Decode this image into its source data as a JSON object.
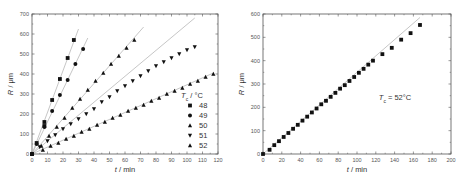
{
  "chart_data": [
    {
      "type": "scatter",
      "title": "",
      "xlabel": "t / min",
      "ylabel": "R / μm",
      "xlim": [
        0,
        120
      ],
      "ylim": [
        0,
        700
      ],
      "xticks": [
        0,
        10,
        20,
        30,
        40,
        50,
        60,
        70,
        80,
        90,
        100,
        110,
        120
      ],
      "yticks": [
        0,
        100,
        200,
        300,
        400,
        500,
        600,
        700
      ],
      "grid": false,
      "legend_title": "Tc / °C",
      "legend_position": "lower right",
      "series": [
        {
          "name": "48",
          "marker": "square",
          "x": [
            0,
            3,
            8,
            8,
            13,
            18,
            23,
            27
          ],
          "y": [
            0,
            55,
            140,
            160,
            270,
            375,
            480,
            570
          ],
          "fit_line": {
            "x0": 0,
            "y0": 0,
            "x1": 30,
            "y1": 625
          }
        },
        {
          "name": "49",
          "marker": "circle",
          "x": [
            0,
            3,
            8,
            13,
            18,
            23,
            28,
            33
          ],
          "y": [
            0,
            50,
            135,
            215,
            295,
            370,
            450,
            525
          ],
          "fit_line": {
            "x0": 0,
            "y0": 0,
            "x1": 36,
            "y1": 580
          }
        },
        {
          "name": "50",
          "marker": "triangle-up",
          "x": [
            0,
            6,
            11,
            16,
            21,
            26,
            31,
            36,
            41,
            46,
            51,
            56,
            61,
            66
          ],
          "y": [
            0,
            40,
            90,
            135,
            180,
            230,
            275,
            320,
            365,
            405,
            450,
            490,
            530,
            570
          ],
          "fit_line": {
            "x0": 0,
            "y0": 0,
            "x1": 72,
            "y1": 635
          }
        },
        {
          "name": "51",
          "marker": "triangle-down",
          "x": [
            0,
            5,
            10,
            15,
            20,
            25,
            30,
            35,
            40,
            45,
            50,
            55,
            60,
            65,
            70,
            75,
            80,
            85,
            90,
            95,
            100,
            105
          ],
          "y": [
            0,
            35,
            65,
            95,
            125,
            150,
            175,
            200,
            225,
            260,
            285,
            315,
            340,
            365,
            390,
            415,
            440,
            460,
            480,
            500,
            520,
            535
          ],
          "fit_line": {
            "x0": 0,
            "y0": 0,
            "x1": 105,
            "y1": 680
          }
        },
        {
          "name": "52",
          "marker": "triangle-up",
          "x": [
            0,
            7,
            12,
            17,
            22,
            27,
            32,
            37,
            42,
            47,
            52,
            57,
            62,
            67,
            72,
            77,
            82,
            87,
            92,
            97,
            102,
            107,
            112,
            117
          ],
          "y": [
            0,
            20,
            40,
            55,
            75,
            90,
            110,
            125,
            145,
            160,
            180,
            195,
            215,
            230,
            245,
            265,
            280,
            300,
            315,
            330,
            350,
            365,
            385,
            400
          ],
          "fit_line": {
            "x0": 0,
            "y0": 0,
            "x1": 117,
            "y1": 405
          }
        }
      ]
    },
    {
      "type": "scatter",
      "title": "",
      "xlabel": "t / min",
      "ylabel": "R / μm",
      "xlim": [
        0,
        200
      ],
      "ylim": [
        0,
        600
      ],
      "xticks": [
        0,
        20,
        40,
        60,
        80,
        100,
        120,
        140,
        160,
        180,
        200
      ],
      "yticks": [
        0,
        100,
        200,
        300,
        400,
        500,
        600
      ],
      "grid": false,
      "annotation": "Tc = 52°C",
      "series": [
        {
          "name": "52",
          "marker": "square",
          "x": [
            0,
            7,
            12,
            17,
            22,
            27,
            32,
            37,
            42,
            47,
            52,
            57,
            62,
            67,
            72,
            77,
            82,
            87,
            92,
            97,
            102,
            107,
            112,
            117,
            127,
            137,
            147,
            157,
            167
          ],
          "y": [
            0,
            18,
            38,
            55,
            73,
            90,
            108,
            125,
            143,
            160,
            178,
            195,
            213,
            228,
            245,
            262,
            280,
            295,
            313,
            330,
            348,
            365,
            383,
            400,
            428,
            455,
            490,
            518,
            553
          ],
          "fit_line": {
            "x0": 0,
            "y0": 0,
            "x1": 167,
            "y1": 585
          }
        }
      ]
    }
  ],
  "left_chart": {
    "xlabel_italic": "t",
    "xlabel_rest": " / min",
    "ylabel_italic": "R",
    "ylabel_rest": " / μm",
    "legend_title_italic": "T",
    "legend_title_sub": "c",
    "legend_title_rest": " / °C",
    "legend": [
      "48",
      "49",
      "50",
      "51",
      "52"
    ]
  },
  "right_chart": {
    "xlabel_italic": "t",
    "xlabel_rest": " / min",
    "ylabel_italic": "R",
    "ylabel_rest": " / μm",
    "annotation_italic": "T",
    "annotation_sub": "c",
    "annotation_rest": " = 52°C"
  },
  "colors": {
    "marker": "#111111",
    "fit_line": "#b8b8b8",
    "axis": "#555555"
  }
}
